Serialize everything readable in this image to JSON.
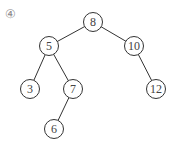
{
  "label": "④",
  "tree": {
    "nodes": [
      {
        "id": "n8",
        "value": "8",
        "x": 93,
        "y": 22
      },
      {
        "id": "n5",
        "value": "5",
        "x": 49,
        "y": 46
      },
      {
        "id": "n10",
        "value": "10",
        "x": 134,
        "y": 46
      },
      {
        "id": "n3",
        "value": "3",
        "x": 30,
        "y": 89
      },
      {
        "id": "n7",
        "value": "7",
        "x": 73,
        "y": 89
      },
      {
        "id": "n12",
        "value": "12",
        "x": 156,
        "y": 89
      },
      {
        "id": "n6",
        "value": "6",
        "x": 54,
        "y": 129
      }
    ],
    "edges": [
      {
        "from": "8",
        "to": "5"
      },
      {
        "from": "8",
        "to": "10"
      },
      {
        "from": "5",
        "to": "3"
      },
      {
        "from": "5",
        "to": "7"
      },
      {
        "from": "10",
        "to": "12"
      },
      {
        "from": "7",
        "to": "6"
      }
    ],
    "node_radius": 9.5
  }
}
